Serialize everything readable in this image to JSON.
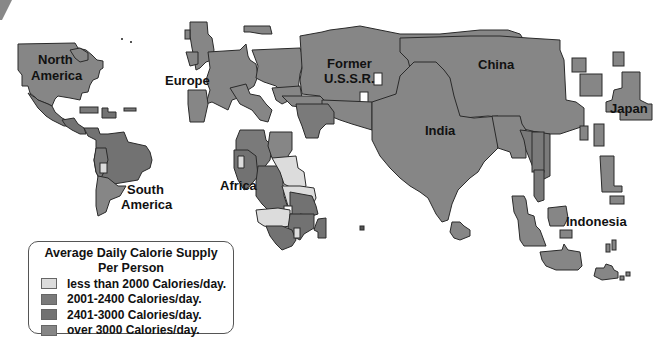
{
  "map": {
    "type": "cartogram",
    "colors": {
      "lt2000": "#dcdcdc",
      "c2001_2400": "#7a7a7a",
      "c2401_3000": "#727272",
      "over3000": "#868686",
      "border": "#2a2a2a"
    },
    "labels": {
      "north_america": [
        "North",
        "America"
      ],
      "south_america": [
        "South",
        "America"
      ],
      "europe": "Europe",
      "ussr": [
        "Former",
        "U.S.S.R."
      ],
      "china": "China",
      "india": "India",
      "japan": "Japan",
      "africa": "Africa",
      "indonesia": "Indonesia"
    }
  },
  "legend": {
    "title_line1": "Average Daily Calorie Supply",
    "title_line2": "Per Person",
    "items": [
      {
        "label": "less than 2000 Calories/day.",
        "color": "#dcdcdc"
      },
      {
        "label": "2001-2400 Calories/day.",
        "color": "#7a7a7a"
      },
      {
        "label": "2401-3000 Calories/day.",
        "color": "#727272"
      },
      {
        "label": "over 3000 Calories/day.",
        "color": "#868686"
      }
    ]
  }
}
